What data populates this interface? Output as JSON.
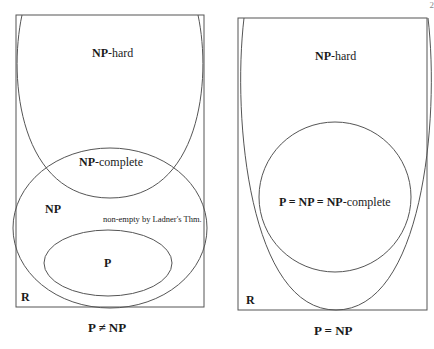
{
  "page_number": "2",
  "left_diagram": {
    "regions": {
      "np_hard": {
        "bold": "NP",
        "rest": "-hard"
      },
      "np_complete": {
        "bold": "NP",
        "rest": "-complete"
      },
      "np": "NP",
      "ladner": "non-empty by Ladner's Thm.",
      "p": "P",
      "r": "R"
    },
    "caption": "P ≠ NP"
  },
  "right_diagram": {
    "regions": {
      "np_hard": {
        "bold": "NP",
        "rest": "-hard"
      },
      "merged": {
        "bold": "P = NP = NP",
        "rest": "-complete"
      },
      "r": "R"
    },
    "caption": "P = NP"
  },
  "colors": {
    "stroke": "#555555",
    "text": "#1a1a1a"
  }
}
